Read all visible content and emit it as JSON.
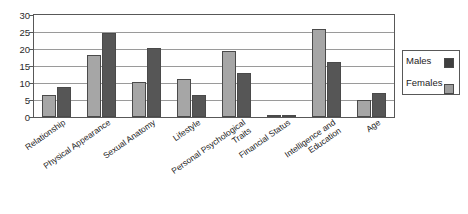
{
  "chart_data": {
    "type": "bar",
    "title": "",
    "subtitle": "",
    "xlabel": "",
    "ylabel": "",
    "ylim": [
      0,
      30
    ],
    "ytick_step": 5,
    "yticks": [
      0,
      5,
      10,
      15,
      20,
      25,
      30
    ],
    "grid": true,
    "legend_position": "right",
    "categories": [
      "Relationship",
      "Physical Appearance",
      "Sexual Anatomy",
      "Lifestyle",
      "Personal Psychological Traits",
      "Financial Status",
      "Intelligence and Education",
      "Age"
    ],
    "category_lines": [
      [
        "Relationship"
      ],
      [
        "Physical Appearance"
      ],
      [
        "Sexual Anatomy"
      ],
      [
        "Lifestyle"
      ],
      [
        "Personal Psychological",
        "Traits"
      ],
      [
        "Financial Status"
      ],
      [
        "Intelligence and",
        "Education"
      ],
      [
        "Age"
      ]
    ],
    "series": [
      {
        "name": "Females",
        "color": "#a6a6a6",
        "values": [
          6.5,
          18.3,
          10.4,
          11.2,
          19.3,
          0.3,
          25.8,
          5.0
        ]
      },
      {
        "name": "Males",
        "color": "#565656",
        "values": [
          8.8,
          24.8,
          20.2,
          6.5,
          13.0,
          0.3,
          16.2,
          7.0
        ]
      }
    ]
  },
  "legend": {
    "entries": [
      {
        "label": "Males",
        "swatch": "males"
      },
      {
        "label": "Females",
        "swatch": "females"
      }
    ]
  },
  "colors": {
    "males": "#565656",
    "females": "#a6a6a6",
    "axis": "#585858",
    "grid": "#9a9a9a",
    "text": "#1c1c1c",
    "background": "#ffffff"
  }
}
